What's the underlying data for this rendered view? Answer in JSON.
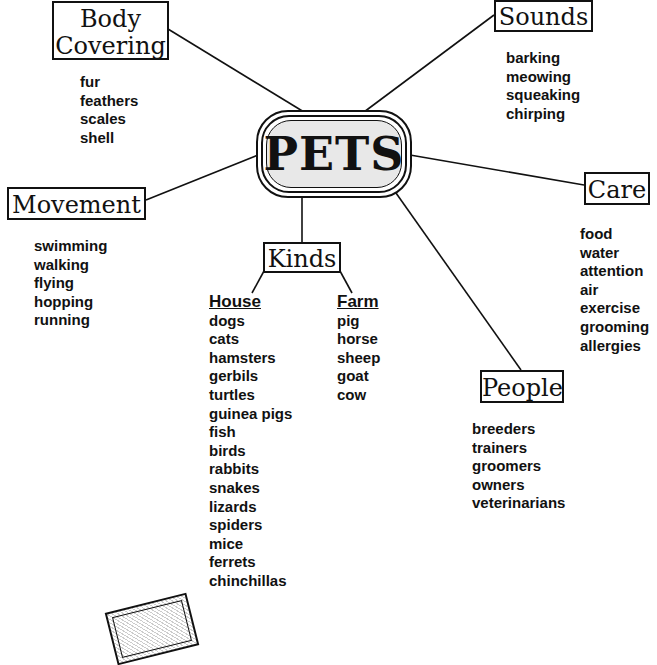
{
  "center": {
    "title": "PETS"
  },
  "nodes": {
    "body_covering": {
      "title_line1": "Body",
      "title_line2": "Covering",
      "items": [
        "fur",
        "feathers",
        "scales",
        "shell"
      ]
    },
    "sounds": {
      "title": "Sounds",
      "items": [
        "barking",
        "meowing",
        "squeaking",
        "chirping"
      ]
    },
    "movement": {
      "title": "Movement",
      "items": [
        "swimming",
        "walking",
        "flying",
        "hopping",
        "running"
      ]
    },
    "care": {
      "title": "Care",
      "items": [
        "food",
        "water",
        "attention",
        "air",
        "exercise",
        "grooming",
        "allergies"
      ]
    },
    "kinds": {
      "title": "Kinds",
      "house": {
        "header": "House",
        "items": [
          "dogs",
          "cats",
          "hamsters",
          "gerbils",
          "turtles",
          "guinea pigs",
          "fish",
          "birds",
          "rabbits",
          "snakes",
          "lizards",
          "spiders",
          "mice",
          "ferrets",
          "chinchillas"
        ]
      },
      "farm": {
        "header": "Farm",
        "items": [
          "pig",
          "horse",
          "sheep",
          "goat",
          "cow"
        ]
      }
    },
    "people": {
      "title": "People",
      "items": [
        "breeders",
        "trainers",
        "groomers",
        "owners",
        "veterinarians"
      ]
    }
  }
}
